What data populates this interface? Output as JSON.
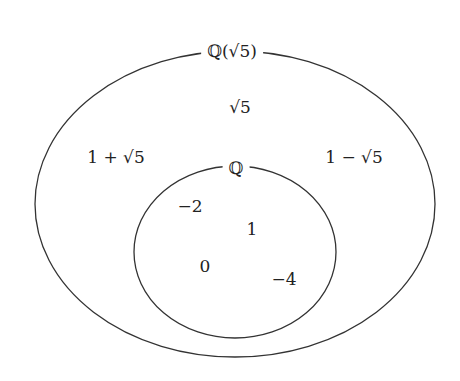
{
  "diagram": {
    "type": "venn-nested-sets",
    "outer_set": {
      "label": "ℚ(√5)",
      "elements": [
        "√5",
        "1 + √5",
        "1 − √5"
      ]
    },
    "inner_set": {
      "label": "ℚ",
      "elements": [
        "−2",
        "1",
        "0",
        "−4"
      ]
    },
    "colors": {
      "stroke": "#333333",
      "text": "#222222",
      "background": "#ffffff"
    }
  }
}
